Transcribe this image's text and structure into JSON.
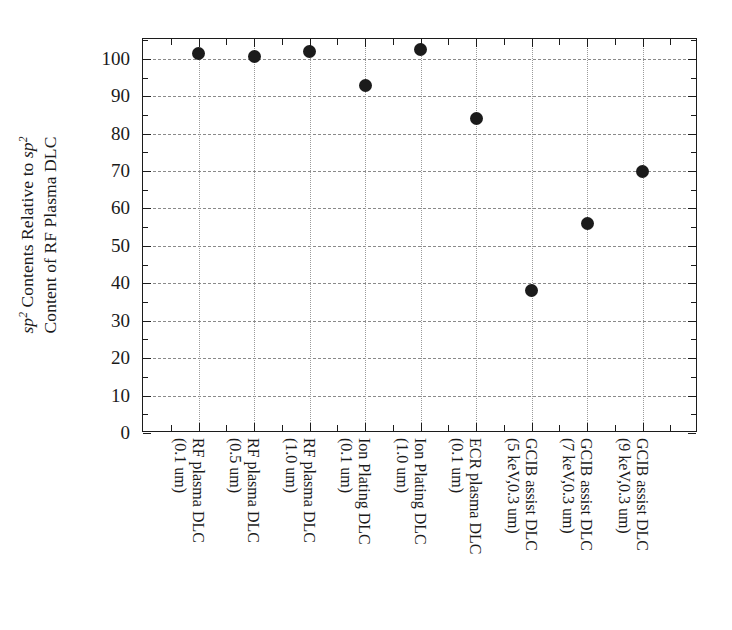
{
  "figure": {
    "kind": "scatter-plot",
    "background": "#ffffff",
    "marker_color": "#1b1b1b",
    "axis_color": "#1c1c1c",
    "grid_color": "#8a8a8a"
  },
  "yaxis": {
    "title_line1": "Contents Relative to",
    "title_line2": "Content of RF Plasma DLC",
    "title_sym1": "sp",
    "title_sym1_sup": "2",
    "title_sym2": "sp",
    "title_sym2_sup": "2",
    "ticks": [
      "0",
      "10",
      "20",
      "30",
      "40",
      "50",
      "60",
      "70",
      "80",
      "90",
      "100"
    ],
    "tick_values": [
      0,
      10,
      20,
      30,
      40,
      50,
      60,
      70,
      80,
      90,
      100
    ],
    "minor_step": 5,
    "min": 0,
    "max": 105.3
  },
  "xaxis": {
    "labels": [
      {
        "line1": "RF plasma DLC",
        "line2": "(0.1 um)"
      },
      {
        "line1": "RF plasma DLC",
        "line2": "(0.5 um)"
      },
      {
        "line1": "RF plasma DLC",
        "line2": "(1.0 um)"
      },
      {
        "line1": "Ion Plating DLC",
        "line2": "(0.1 um)"
      },
      {
        "line1": "Ion Plating DLC",
        "line2": "(1.0 um)"
      },
      {
        "line1": "ECR plasma DLC",
        "line2": "(0.1 um)"
      },
      {
        "line1": "GCIB assist DLC",
        "line2": "(5 keV,0.3 um)"
      },
      {
        "line1": "GCIB assist DLC",
        "line2": "(7 keV,0.3 um)"
      },
      {
        "line1": "GCIB assist DLC",
        "line2": "(9 keV,0.3 um)"
      }
    ]
  },
  "chart_data": {
    "type": "scatter",
    "title": "",
    "xlabel": "",
    "ylabel": "sp2 Contents Relative to sp2 Content of RF Plasma DLC",
    "categories": [
      "RF plasma DLC (0.1 um)",
      "RF plasma DLC (0.5 um)",
      "RF plasma DLC (1.0 um)",
      "Ion Plating DLC (0.1 um)",
      "Ion Plating DLC (1.0 um)",
      "ECR plasma DLC (0.1 um)",
      "GCIB assist DLC (5 keV,0.3 um)",
      "GCIB assist DLC (7 keV,0.3 um)",
      "GCIB assist DLC (9 keV,0.3 um)"
    ],
    "values": [
      101.5,
      100.5,
      102,
      93,
      102.5,
      84,
      38,
      56,
      70
    ],
    "ylim": [
      0,
      105.3
    ],
    "ytick_step": 10,
    "yminor_step": 5,
    "grid": true,
    "legend": "none",
    "marker": "filled-circle"
  }
}
